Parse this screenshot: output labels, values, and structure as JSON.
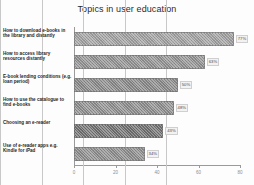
{
  "chart_data": {
    "type": "bar",
    "orientation": "horizontal",
    "title": "Topics in user education",
    "xlabel": "",
    "ylabel": "",
    "xlim": [
      0,
      80
    ],
    "xticks": [
      0,
      20,
      40,
      60,
      80
    ],
    "xticklabels": [
      "0",
      "20",
      "40",
      "60",
      "80"
    ],
    "grid": true,
    "legend": false,
    "categories": [
      "How to download e-books in the library and distantly",
      "How to access library resources distantly",
      "E-book lending conditions (e.g. loan period)",
      "How to use the catalogue to find e-books",
      "Choosing an e-reader",
      "Use of e-reader apps e.g. Kindle for iPad"
    ],
    "values": [
      77,
      63,
      50,
      48,
      43,
      34
    ],
    "value_labels": [
      "77%",
      "63%",
      "50%",
      "48%",
      "43%",
      "34%"
    ],
    "bar_colors": [
      "#9e9e9e",
      "#8f8f8f",
      "#868686",
      "#8b8b8b",
      "#6e6e6e",
      "#8a8a8a"
    ]
  },
  "colors": {
    "background": "#fdfdfd",
    "axis": "#9a9a9a",
    "grid": "#c8c8c8",
    "title_text": "#2b2b2b",
    "label_text": "#1f1f1f",
    "tick_text": "#8d8d8d"
  }
}
